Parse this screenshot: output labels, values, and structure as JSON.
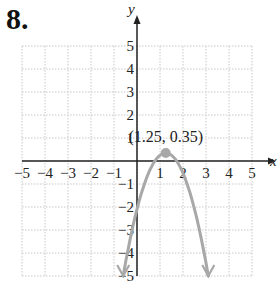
{
  "problem_number": "8.",
  "chart_data": {
    "type": "line",
    "title": "",
    "xlabel": "x",
    "ylabel": "y",
    "xlim": [
      -5,
      5
    ],
    "ylim": [
      -5,
      5
    ],
    "grid": true,
    "x_ticks": [
      "-5",
      "-4",
      "-3",
      "-2",
      "-1",
      "1",
      "2",
      "3",
      "4",
      "5"
    ],
    "y_ticks": [
      "5",
      "4",
      "3",
      "2",
      "1",
      "-1",
      "-2",
      "-3",
      "-4",
      "-5"
    ],
    "series": [
      {
        "name": "parabola",
        "color": "#a8a8a8",
        "equation_form": "downward-opening parabola",
        "vertex": [
          1.25,
          0.35
        ],
        "x": [
          -0.6,
          0,
          0.7,
          1.25,
          1.8,
          2.5,
          3.1
        ],
        "y": [
          -5,
          -1.9,
          -0.1,
          0.35,
          -0.1,
          -1.9,
          -5
        ]
      }
    ],
    "annotations": [
      {
        "text": "(1.25, 0.35)",
        "x": 1.25,
        "y": 0.35,
        "marker": "dot"
      }
    ]
  },
  "labels": {
    "vertex_label": "(1.25, 0.35)",
    "x_axis": "x",
    "y_axis": "y"
  }
}
